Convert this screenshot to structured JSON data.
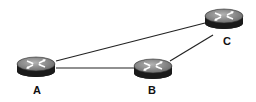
{
  "diagram": {
    "type": "network-topology",
    "nodes": [
      {
        "id": "A",
        "label": "A",
        "kind": "router",
        "cx": 36,
        "cy": 66,
        "label_x": 37,
        "label_y": 85
      },
      {
        "id": "B",
        "label": "B",
        "kind": "router",
        "cx": 153,
        "cy": 68,
        "label_x": 152,
        "label_y": 85
      },
      {
        "id": "C",
        "label": "C",
        "kind": "router",
        "cx": 224,
        "cy": 18,
        "label_x": 227,
        "label_y": 36
      }
    ],
    "edges": [
      {
        "from": "A",
        "to": "C"
      },
      {
        "from": "A",
        "to": "B"
      },
      {
        "from": "B",
        "to": "C"
      }
    ],
    "colors": {
      "line": "#222222",
      "router_top": "#8a8a8a",
      "router_side": "#1a1a1a",
      "arrow": "#ffffff",
      "label": "#111111"
    }
  }
}
